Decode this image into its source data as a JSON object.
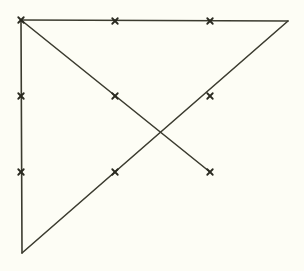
{
  "figure": {
    "canvas": {
      "width": 304,
      "height": 271
    },
    "colors": {
      "background": "#fdfdf5",
      "stroke": "#3b3b2f",
      "marker": "#2a2a20"
    },
    "stroke_width": 1.6,
    "marker_stroke_width": 1.8,
    "marker_size": 5.5,
    "vertices": [
      {
        "name": "top-left",
        "x": 21,
        "y": 20
      },
      {
        "name": "top-right",
        "x": 288,
        "y": 21
      },
      {
        "name": "bottom-left",
        "x": 22,
        "y": 253
      }
    ],
    "segments": [
      {
        "name": "top-edge",
        "x1": 21,
        "y1": 20,
        "x2": 288,
        "y2": 21
      },
      {
        "name": "left-edge",
        "x1": 21,
        "y1": 20,
        "x2": 22,
        "y2": 253
      },
      {
        "name": "hypotenuse-ascending",
        "x1": 22,
        "y1": 253,
        "x2": 288,
        "y2": 21
      },
      {
        "name": "interior-diagonal-descending",
        "x1": 21,
        "y1": 20,
        "x2": 210,
        "y2": 172
      }
    ],
    "intersection": {
      "name": "diagonal-crossing",
      "x": 161,
      "y": 135
    },
    "markers": [
      {
        "name": "marker-top-left",
        "x": 21,
        "y": 20
      },
      {
        "name": "marker-top-middle",
        "x": 115,
        "y": 21
      },
      {
        "name": "marker-top-right-inner",
        "x": 210,
        "y": 21
      },
      {
        "name": "marker-left-middle",
        "x": 21,
        "y": 96
      },
      {
        "name": "marker-center-left",
        "x": 115,
        "y": 96
      },
      {
        "name": "marker-center-right",
        "x": 210,
        "y": 96
      },
      {
        "name": "marker-left-lower",
        "x": 21,
        "y": 172
      },
      {
        "name": "marker-bottom-middle",
        "x": 115,
        "y": 172
      },
      {
        "name": "marker-bottom-right",
        "x": 210,
        "y": 172
      }
    ]
  }
}
